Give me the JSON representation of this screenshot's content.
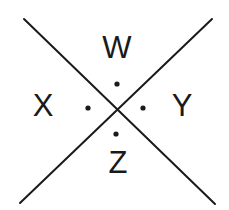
{
  "diagram": {
    "type": "intersecting-lines-angles",
    "colors": {
      "background": "#ffffff",
      "ink": "#1a1a1a"
    },
    "lines": [
      {
        "name": "line-descending",
        "from": [
          24,
          19
        ],
        "to": [
          215,
          204
        ]
      },
      {
        "name": "line-ascending",
        "from": [
          20,
          203
        ],
        "to": [
          212,
          19
        ]
      }
    ],
    "intersection": [
      117,
      109
    ],
    "angles": [
      {
        "label": "W",
        "position": "top",
        "label_xy": [
          117,
          58
        ],
        "dot_xy": [
          117,
          84
        ]
      },
      {
        "label": "X",
        "position": "left",
        "label_xy": [
          43,
          116
        ],
        "dot_xy": [
          88,
          108
        ]
      },
      {
        "label": "Y",
        "position": "right",
        "label_xy": [
          182,
          116
        ],
        "dot_xy": [
          143,
          108
        ]
      },
      {
        "label": "Z",
        "position": "bottom",
        "label_xy": [
          118,
          173
        ],
        "dot_xy": [
          116,
          134
        ]
      }
    ]
  }
}
